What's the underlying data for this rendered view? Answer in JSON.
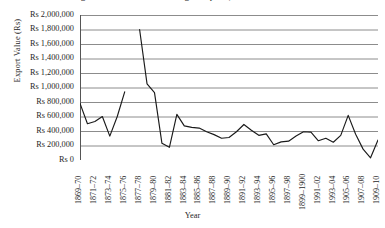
{
  "chart_data": {
    "type": "line",
    "title": "Figure 2. Value of Indian Ginger Exports, 1869–70 to 1909–10",
    "xlabel": "Year",
    "ylabel": "Export Value (Rs)",
    "ylim": [
      0,
      2000000
    ],
    "ytick_step": 200000,
    "ytick_labels": [
      "Rs 2,000,000",
      "Rs 1,800,000",
      "Rs 1,600,000",
      "Rs 1,400,000",
      "Rs 1,200,000",
      "Rs 1,000,000",
      "Rs 800,000",
      "Rs 600,000",
      "Rs 400,000",
      "Rs 200,000",
      "Rs 0"
    ],
    "ytick_values": [
      2000000,
      1800000,
      1600000,
      1400000,
      1200000,
      1000000,
      800000,
      600000,
      400000,
      200000,
      0
    ],
    "grid": true,
    "grid_axis": "y",
    "legend": "none",
    "line_color": "#1a1a1a",
    "grid_color": "#8c8c8c",
    "axis_color": "#555555",
    "xtick_labels": [
      "1869–70",
      "1871–72",
      "1873–74",
      "1875–76",
      "1877–78",
      "1879–80",
      "1881–82",
      "1883–84",
      "1885–86",
      "1887–88",
      "1889–90",
      "1891–92",
      "1893–94",
      "1895–96",
      "1897–98",
      "1899–1900",
      "1991–02",
      "1993–04",
      "1905–06",
      "1907–08",
      "1909–10"
    ],
    "xtick_interval": 2,
    "x": [
      "1869–70",
      "1870–71",
      "1871–72",
      "1872–73",
      "1873–74",
      "1874–75",
      "1875–76",
      "1876–77",
      "1877–78",
      "1878–79",
      "1879–80",
      "1880–81",
      "1881–82",
      "1882–83",
      "1883–84",
      "1884–85",
      "1885–86",
      "1886–87",
      "1887–88",
      "1888–89",
      "1889–90",
      "1890–91",
      "1891–92",
      "1892–93",
      "1893–94",
      "1894–95",
      "1895–96",
      "1896–97",
      "1897–98",
      "1898–99",
      "1899–1900",
      "1900–01",
      "1901–02",
      "1902–03",
      "1903–04",
      "1904–05",
      "1905–06",
      "1906–07",
      "1907–08",
      "1908–09",
      "1909–10"
    ],
    "values": [
      780000,
      500000,
      530000,
      600000,
      330000,
      600000,
      940000,
      null,
      1800000,
      1050000,
      930000,
      230000,
      175000,
      630000,
      470000,
      450000,
      440000,
      390000,
      350000,
      300000,
      310000,
      390000,
      490000,
      410000,
      340000,
      360000,
      210000,
      250000,
      260000,
      330000,
      390000,
      385000,
      265000,
      300000,
      245000,
      340000,
      615000,
      355000,
      150000,
      30000,
      275000
    ],
    "series_note": "Single series with a line break after 1875–76",
    "annotations": []
  }
}
